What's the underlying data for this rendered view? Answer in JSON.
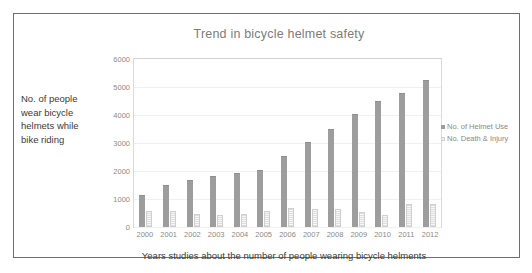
{
  "chart_data": {
    "type": "bar",
    "title": "Trend in bicycle helmet safety",
    "xlabel": "Years studies about the number of people wearing bicycle helments",
    "ylabel": "No. of people wear bicycle helmets while bike riding",
    "categories": [
      "2000",
      "2001",
      "2002",
      "2003",
      "2004",
      "2005",
      "2006",
      "2007",
      "2008",
      "2009",
      "2010",
      "2011",
      "2012"
    ],
    "series": [
      {
        "name": "No. of Helmet Use",
        "color": "#9d9d9d",
        "values": [
          1100,
          1450,
          1650,
          1780,
          1880,
          2000,
          2500,
          3000,
          3480,
          4000,
          4480,
          4750,
          5200
        ]
      },
      {
        "name": "No. Death & Injury",
        "color": "#f2f2f2",
        "values": [
          580,
          580,
          480,
          420,
          480,
          580,
          680,
          630,
          640,
          530,
          420,
          820,
          820
        ]
      }
    ],
    "ylim": [
      0,
      6000
    ],
    "yticks": [
      "6000",
      "5000",
      "4000",
      "3000",
      "2000",
      "1000",
      "0"
    ],
    "grid": true,
    "legend_position": "right"
  },
  "ylabel_lines": [
    "No. of people",
    "wear bicycle",
    "helmets while",
    "bike riding"
  ]
}
